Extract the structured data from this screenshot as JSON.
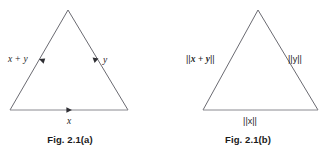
{
  "figure": {
    "background_color": "#ffffff",
    "line_color": "#6b6b72",
    "text_color": "#262626",
    "panels": [
      {
        "id": "panel-a",
        "caption": "Fig. 2.1(a)",
        "kind": "vector-triangle",
        "labels": {
          "left_edge": "x + y",
          "right_edge": "y",
          "bottom_edge": "x"
        },
        "arrows": [
          {
            "edge": "left",
            "direction": "up-left",
            "label": "x + y"
          },
          {
            "edge": "right",
            "direction": "down-right",
            "label": "y"
          },
          {
            "edge": "bottom",
            "direction": "right",
            "label": "x"
          }
        ],
        "geometry": {
          "apex": [
            68,
            10
          ],
          "bottom_left": [
            10,
            110
          ],
          "bottom_right": [
            128,
            110
          ]
        }
      },
      {
        "id": "panel-b",
        "caption": "Fig. 2.1(b)",
        "kind": "norm-triangle",
        "labels": {
          "left_edge_prefix": "||",
          "left_edge_x": "x",
          "left_edge_plus": " + ",
          "left_edge_y": "y",
          "left_edge_suffix": "||",
          "left_edge": "||x + y||",
          "right_edge": "||y||",
          "bottom_edge": "||x||"
        },
        "arrows": [],
        "geometry": {
          "apex": [
            258,
            10
          ],
          "bottom_left": [
            203,
            110
          ],
          "bottom_right": [
            318,
            110
          ]
        }
      }
    ]
  }
}
